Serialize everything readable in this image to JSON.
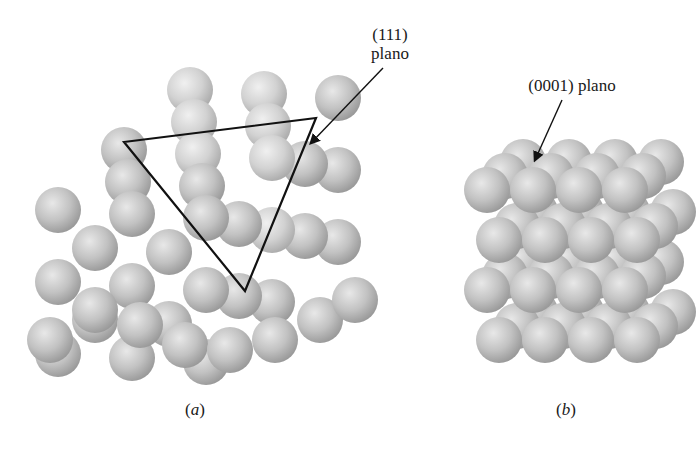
{
  "figure": {
    "panel_a": {
      "caption_open": "(",
      "caption_letter": "a",
      "caption_close": ")",
      "label_line1": "(111)",
      "label_line2": "plano",
      "structure": "FCC close-packed spheres with (111) triangular plane outlined"
    },
    "panel_b": {
      "caption_open": "(",
      "caption_letter": "b",
      "caption_close": ")",
      "label": "(0001) plano",
      "structure": "HCP close-packed spheres with (0001) basal plane"
    },
    "colors": {
      "sphere_light": "#e6e6e6",
      "sphere_mid": "#bdbdbd",
      "sphere_dark": "#8f8f8f",
      "outline": "#111111",
      "background": "#ffffff"
    }
  }
}
